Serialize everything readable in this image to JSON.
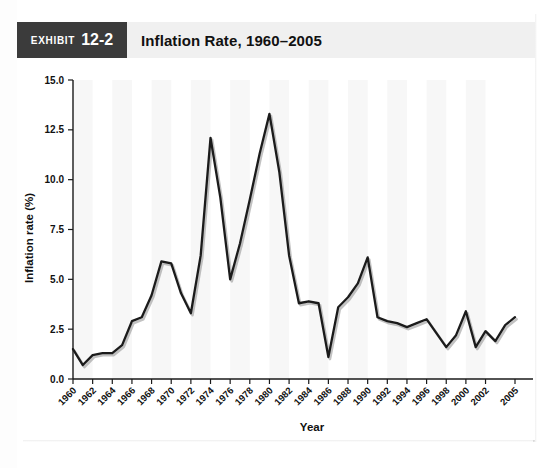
{
  "exhibit": {
    "label": "EXHIBIT",
    "number": "12-2",
    "title": "Inflation Rate, 1960–2005"
  },
  "chart_data": {
    "type": "line",
    "title": "Inflation Rate, 1960–2005",
    "xlabel": "Year",
    "ylabel": "Inflation rate (%)",
    "ylim": [
      0.0,
      15.0
    ],
    "yticks": [
      0.0,
      2.5,
      5.0,
      7.5,
      10.0,
      12.5,
      15.0
    ],
    "ytick_labels": [
      "0.0",
      "2.5",
      "5.0",
      "7.5",
      "10.0",
      "12.5",
      "15.0"
    ],
    "xtick_labels": [
      "1960",
      "1962",
      "1964",
      "1966",
      "1968",
      "1970",
      "1972",
      "1974",
      "1976",
      "1978",
      "1980",
      "1982",
      "1984",
      "1986",
      "1988",
      "1990",
      "1992",
      "1994",
      "1996",
      "1998",
      "2000",
      "2002",
      "2005"
    ],
    "grid": false,
    "legend": null,
    "line_color": "#1b1b1b",
    "x": [
      1960,
      1961,
      1962,
      1963,
      1964,
      1965,
      1966,
      1967,
      1968,
      1969,
      1970,
      1971,
      1972,
      1973,
      1974,
      1975,
      1976,
      1977,
      1978,
      1979,
      1980,
      1981,
      1982,
      1983,
      1984,
      1985,
      1986,
      1987,
      1988,
      1989,
      1990,
      1991,
      1992,
      1993,
      1994,
      1995,
      1996,
      1997,
      1998,
      1999,
      2000,
      2001,
      2002,
      2003,
      2004,
      2005
    ],
    "values": [
      1.5,
      0.7,
      1.2,
      1.3,
      1.3,
      1.7,
      2.9,
      3.1,
      4.2,
      5.9,
      5.8,
      4.3,
      3.3,
      6.2,
      12.1,
      9.1,
      5.0,
      6.8,
      9.0,
      11.3,
      13.3,
      10.4,
      6.2,
      3.8,
      3.9,
      3.8,
      1.1,
      3.6,
      4.1,
      4.8,
      6.1,
      3.1,
      2.9,
      2.8,
      2.6,
      2.8,
      3.0,
      2.3,
      1.6,
      2.2,
      3.4,
      1.6,
      2.4,
      1.9,
      2.7,
      3.1
    ]
  },
  "axis": {
    "y_title": "Inflation rate (%)",
    "x_title": "Year"
  }
}
